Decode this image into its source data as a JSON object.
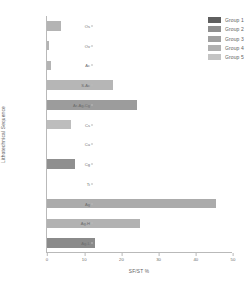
{
  "chart_data": {
    "type": "bar",
    "orientation": "horizontal",
    "title": "",
    "xlabel": "SF/ST %",
    "ylabel": "Lithotechnical Sequence",
    "xlim": [
      0,
      50
    ],
    "xticks": [
      0,
      10,
      20,
      30,
      40,
      50
    ],
    "grid": false,
    "legend_position": "top-right",
    "categories": [
      "Os",
      "Ov",
      "Ac",
      "S-Ac",
      "Ar-Ag-Cg",
      "Cs",
      "Cu",
      "Cg",
      "Ti",
      "Ag",
      "Ag-H",
      "Ag-L"
    ],
    "values": [
      3.8,
      0.5,
      1.0,
      17.8,
      24.2,
      6.5,
      0.0,
      7.5,
      0.0,
      45.5,
      25.0,
      13.0
    ],
    "bar_colors": [
      "#b4b4b4",
      "#b4b4b4",
      "#b4b4b4",
      "#b6b6b6",
      "#9c9c9c",
      "#bdbdbd",
      "#bdbdbd",
      "#8f8f8f",
      "#8f8f8f",
      "#ababab",
      "#b2b2b2",
      "#8a8a8a"
    ],
    "legend": [
      {
        "label": "Group 1",
        "color": "#5f5f5f"
      },
      {
        "label": "Group 2",
        "color": "#8f8f8f"
      },
      {
        "label": "Group 3",
        "color": "#a0a0a0"
      },
      {
        "label": "Group 4",
        "color": "#b0b0b0"
      },
      {
        "label": "Group 5",
        "color": "#c4c4c4"
      }
    ]
  }
}
